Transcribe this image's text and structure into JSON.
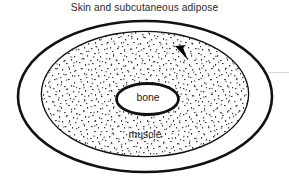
{
  "figure": {
    "title": "Skin and subcutaneous adipose",
    "background_color": "#ffffff",
    "stroke_color": "#111111",
    "text_color": "#2b2b2b"
  },
  "layers": {
    "outer": {
      "label": "Skin and subcutaneous adipose",
      "name": "skin-subcutaneous-adipose-ellipse",
      "fill": "#ffffff"
    },
    "middle": {
      "label": "muscle",
      "name": "muscle-ellipse",
      "fill": "#ffffff",
      "texture": "stipple"
    },
    "inner": {
      "label": "bone",
      "name": "bone-ellipse",
      "fill": "#ffffff"
    }
  },
  "marker": {
    "name": "arrowhead-marker",
    "color": "#000000",
    "direction": "up-left"
  }
}
